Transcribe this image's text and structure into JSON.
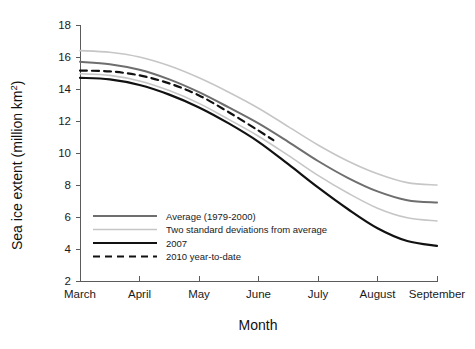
{
  "chart_data": {
    "type": "line",
    "title": "",
    "xlabel": "Month",
    "ylabel": "Sea ice extent (million km 2)",
    "ylabel_main": "Sea ice extent (million km",
    "ylabel_sup": "2",
    "ylabel_tail": ")",
    "xlim": [
      3,
      9
    ],
    "ylim": [
      2,
      18
    ],
    "grid": false,
    "legend_position": "inside-lower-left",
    "categories": [
      "March",
      "April",
      "May",
      "June",
      "July",
      "August",
      "September"
    ],
    "xticklabels": [
      "March",
      "April",
      "May",
      "June",
      "July",
      "August",
      "September"
    ],
    "yticklabels": [
      "18",
      "16",
      "14",
      "12",
      "10",
      "8",
      "6",
      "4",
      "2"
    ],
    "yticks": [
      18,
      16,
      14,
      12,
      10,
      8,
      6,
      4,
      2
    ],
    "xticks": [
      3,
      4,
      5,
      6,
      7,
      8,
      9
    ],
    "series": [
      {
        "name": "Average (1979-2000)",
        "color": "#6e6e6e",
        "width": 2.0,
        "dash": "none",
        "x": [
          3,
          3.5,
          4,
          4.5,
          5,
          5.5,
          6,
          6.5,
          7,
          7.5,
          8,
          8.5,
          9
        ],
        "values": [
          15.7,
          15.55,
          15.2,
          14.6,
          13.8,
          12.85,
          11.85,
          10.7,
          9.5,
          8.45,
          7.6,
          7.05,
          6.9
        ]
      },
      {
        "name": "Two standard deviations from average",
        "color": "#c6c6c6",
        "width": 1.6,
        "dash": "none",
        "x": [
          3,
          3.5,
          4,
          4.5,
          5,
          5.5,
          6,
          6.5,
          7,
          7.5,
          8,
          8.5,
          9
        ],
        "values": [
          16.4,
          16.3,
          16.0,
          15.45,
          14.7,
          13.8,
          12.8,
          11.65,
          10.5,
          9.5,
          8.7,
          8.15,
          8.0
        ],
        "band": "upper"
      },
      {
        "name": "Two standard deviations from average",
        "color": "#c6c6c6",
        "width": 1.6,
        "dash": "none",
        "x": [
          3,
          3.5,
          4,
          4.5,
          5,
          5.5,
          6,
          6.5,
          7,
          7.5,
          8,
          8.5,
          9
        ],
        "values": [
          14.95,
          14.85,
          14.5,
          13.9,
          13.1,
          12.1,
          11.05,
          9.85,
          8.6,
          7.5,
          6.55,
          5.95,
          5.75
        ],
        "band": "lower",
        "legend_hidden": true
      },
      {
        "name": "2007",
        "color": "#111111",
        "width": 2.2,
        "dash": "none",
        "x": [
          3,
          3.5,
          4,
          4.5,
          5,
          5.5,
          6,
          6.5,
          7,
          7.5,
          8,
          8.5,
          9
        ],
        "values": [
          14.7,
          14.6,
          14.25,
          13.65,
          12.85,
          11.85,
          10.7,
          9.3,
          7.85,
          6.5,
          5.3,
          4.5,
          4.2
        ]
      },
      {
        "name": "2010 year-to-date",
        "color": "#111111",
        "width": 2.2,
        "dash": "7,5",
        "x": [
          3,
          3.5,
          4,
          4.5,
          5,
          5.5,
          6,
          6.25
        ],
        "values": [
          15.15,
          15.1,
          14.85,
          14.35,
          13.6,
          12.55,
          11.4,
          10.8
        ]
      }
    ],
    "legend": [
      {
        "label": "Average (1979-2000)",
        "color": "#6e6e6e",
        "width": 2.0,
        "dash": "none"
      },
      {
        "label": "Two standard deviations from average",
        "color": "#c6c6c6",
        "width": 1.6,
        "dash": "none"
      },
      {
        "label": "2007",
        "color": "#111111",
        "width": 2.2,
        "dash": "none"
      },
      {
        "label": "2010 year-to-date",
        "color": "#111111",
        "width": 2.2,
        "dash": "7,5"
      }
    ],
    "colors": {
      "average": "#6e6e6e",
      "stddev": "#c6c6c6",
      "year_2007": "#111111",
      "year_2010": "#111111",
      "axis": "#5b5b5b",
      "text": "#1a1a1a",
      "background": "#ffffff"
    }
  }
}
